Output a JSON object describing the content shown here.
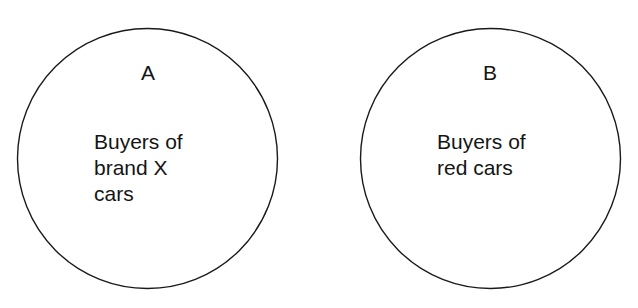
{
  "diagram": {
    "type": "euler-diagram-disjoint-sets",
    "background_color": "#ffffff",
    "stroke_color": "#1a1a1a",
    "text_color": "#151515",
    "sets": [
      {
        "id": "A",
        "label": "A",
        "caption": "Buyers of\nbrand X\ncars",
        "caption_lines": [
          "Buyers of",
          "brand X",
          "cars"
        ],
        "center_x": 147,
        "center_y": 158,
        "radius": 130
      },
      {
        "id": "B",
        "label": "B",
        "caption": "Buyers of\nred cars",
        "caption_lines": [
          "Buyers of",
          "red cars"
        ],
        "center_x": 490,
        "center_y": 158,
        "radius": 130
      }
    ]
  }
}
